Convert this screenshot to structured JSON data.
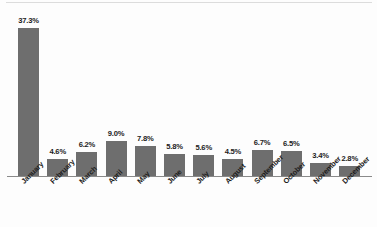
{
  "chart_data": {
    "type": "bar",
    "title": "",
    "subtitle": "",
    "xlabel": "",
    "ylabel": "",
    "grid": false,
    "legend": false,
    "axis_color": "#8a8a8a",
    "bar_color": "#6e6e6e",
    "label_color": "#1c1c1c",
    "background": "#fdfdfd",
    "ylim": [
      0,
      37.3
    ],
    "value_suffix": "%",
    "categories": [
      "January",
      "February",
      "March",
      "April",
      "May",
      "June",
      "July",
      "August",
      "September",
      "October",
      "November",
      "December"
    ],
    "values": [
      37.3,
      4.6,
      6.2,
      9.0,
      7.8,
      5.8,
      5.6,
      4.5,
      6.7,
      6.5,
      3.4,
      2.8
    ],
    "data_labels": [
      "37.3%",
      "4.6%",
      "6.2%",
      "9.0%",
      "7.8%",
      "5.8%",
      "5.6%",
      "4.5%",
      "6.7%",
      "6.5%",
      "3.4%",
      "2.8%"
    ]
  }
}
